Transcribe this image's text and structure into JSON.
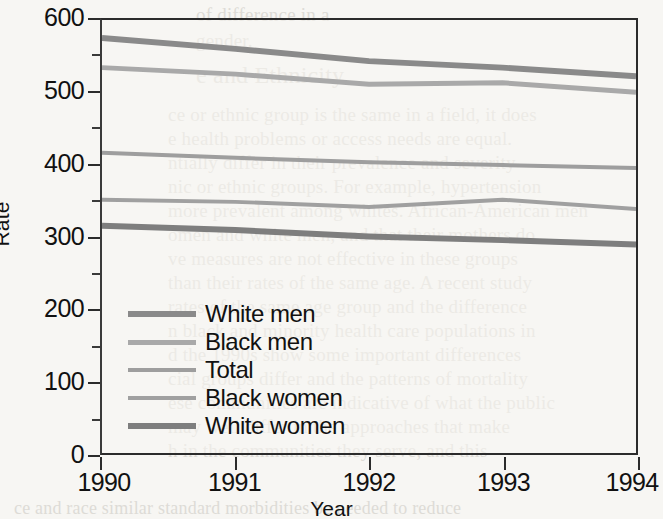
{
  "figure": {
    "background_color": "#f7f6f3",
    "axis_color": "#2b2b2b"
  },
  "axes": {
    "y_title": "Rate",
    "x_title": "Year",
    "y_major_ticks": [
      "600",
      "500",
      "400",
      "300",
      "200",
      "100",
      "0"
    ],
    "y_major_values": [
      600,
      500,
      400,
      300,
      200,
      100,
      0
    ],
    "y_minor_values": [
      550,
      450,
      350,
      250,
      150,
      50
    ],
    "x_ticks": [
      "1990",
      "1991",
      "1992",
      "1993",
      "1994"
    ]
  },
  "legend": {
    "entries": [
      {
        "label": "White men",
        "color": "#8a8a8a",
        "width": 6
      },
      {
        "label": "Black men",
        "color": "#a9a9a9",
        "width": 5
      },
      {
        "label": "Total",
        "color": "#9e9e9e",
        "width": 4
      },
      {
        "label": "Black women",
        "color": "#a0a0a0",
        "width": 4
      },
      {
        "label": "White women",
        "color": "#7e7e7e",
        "width": 6
      }
    ]
  },
  "chart_data": {
    "type": "line",
    "title": "",
    "xlabel": "Year",
    "ylabel": "Rate",
    "categories": [
      "1990",
      "1991",
      "1992",
      "1993",
      "1994"
    ],
    "x": [
      1990,
      1991,
      1992,
      1993,
      1994
    ],
    "xlim": [
      1990,
      1994
    ],
    "ylim": [
      0,
      600
    ],
    "grid": false,
    "legend_position": "inside-lower-left",
    "series": [
      {
        "name": "White men",
        "color": "#8a8a8a",
        "values": [
          575,
          560,
          543,
          534,
          522
        ]
      },
      {
        "name": "Black men",
        "color": "#a9a9a9",
        "values": [
          534,
          525,
          511,
          513,
          500
        ]
      },
      {
        "name": "Total",
        "color": "#9e9e9e",
        "values": [
          416,
          409,
          403,
          399,
          395
        ]
      },
      {
        "name": "Black women",
        "color": "#a0a0a0",
        "values": [
          351,
          348,
          341,
          351,
          338
        ]
      },
      {
        "name": "White women",
        "color": "#7e7e7e",
        "values": [
          315,
          309,
          300,
          295,
          289
        ]
      }
    ]
  },
  "bleed_text": [
    {
      "text": "of difference in a",
      "x": 196,
      "y": 4,
      "size": 19
    },
    {
      "text": "gender.",
      "x": 196,
      "y": 30,
      "size": 19
    },
    {
      "text": "e and Ethnicity",
      "x": 196,
      "y": 62,
      "size": 24
    },
    {
      "text": "ce or ethnic group is the same in a field, it does",
      "x": 168,
      "y": 104,
      "size": 19
    },
    {
      "text": "e health problems or access needs are equal.",
      "x": 168,
      "y": 128,
      "size": 19
    },
    {
      "text": "ntially differ in their prevalence and severity",
      "x": 168,
      "y": 152,
      "size": 19
    },
    {
      "text": "nic or ethnic groups. For example, hypertension",
      "x": 168,
      "y": 176,
      "size": 19
    },
    {
      "text": "more prevalent among whites. African-American men",
      "x": 168,
      "y": 200,
      "size": 19
    },
    {
      "text": "omen and white men, and that their mothers do",
      "x": 168,
      "y": 224,
      "size": 19
    },
    {
      "text": "ve measures are not effective in these groups",
      "x": 168,
      "y": 248,
      "size": 19
    },
    {
      "text": "than their rates of the same age. A recent study",
      "x": 168,
      "y": 272,
      "size": 19
    },
    {
      "text": "rates of the same age group and the difference",
      "x": 168,
      "y": 296,
      "size": 19
    },
    {
      "text": "n black and minority health care populations in",
      "x": 168,
      "y": 320,
      "size": 19
    },
    {
      "text": "d the 1990s show some important differences",
      "x": 168,
      "y": 344,
      "size": 19
    },
    {
      "text": "cial groups differ and the patterns of mortality",
      "x": 168,
      "y": 368,
      "size": 19
    },
    {
      "text": "ese communities are indicative of what the public",
      "x": 168,
      "y": 392,
      "size": 19
    },
    {
      "text": "may well differ in the approaches that make",
      "x": 168,
      "y": 416,
      "size": 19
    },
    {
      "text": "h in the communities they serve, and this",
      "x": 168,
      "y": 440,
      "size": 19
    },
    {
      "text": "ce and race similar standard morbidities be needed to reduce",
      "x": 14,
      "y": 498,
      "size": 18
    }
  ]
}
